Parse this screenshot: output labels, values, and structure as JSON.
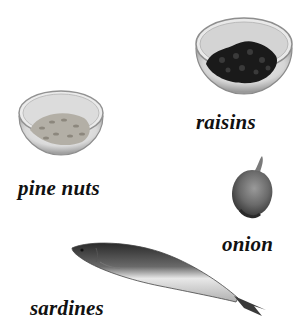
{
  "items": [
    {
      "id": "raisins",
      "label": "raisins",
      "icon": "bowl-of-raisins-icon"
    },
    {
      "id": "pine_nuts",
      "label": "pine nuts",
      "icon": "bowl-of-pine-nuts-icon"
    },
    {
      "id": "onion",
      "label": "onion",
      "icon": "onion-icon"
    },
    {
      "id": "sardines",
      "label": "sardines",
      "icon": "sardine-fish-icon"
    }
  ],
  "colors": {
    "background": "#ffffff",
    "label_text": "#111111",
    "raisins": "#1a1a1a",
    "pine_nuts": "#a9a59c",
    "bowl_glass": "#c9c9c9",
    "onion": "#6b6b6b",
    "fish_dark": "#2e2e2e",
    "fish_light": "#e6e6e6"
  }
}
